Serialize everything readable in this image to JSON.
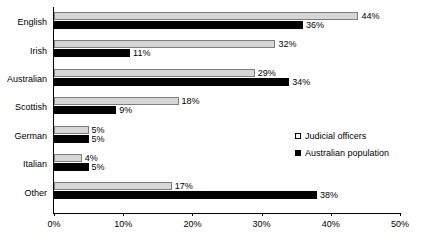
{
  "chart_data": {
    "type": "bar",
    "orientation": "horizontal",
    "title": "",
    "xlabel": "",
    "ylabel": "",
    "xlim": [
      0,
      50
    ],
    "grid": false,
    "legend_position": "middle-right",
    "categories": [
      "English",
      "Irish",
      "Australian",
      "Scottish",
      "German",
      "Italian",
      "Other"
    ],
    "x_tick_labels": [
      "0%",
      "10%",
      "20%",
      "30%",
      "40%",
      "50%"
    ],
    "x_ticks": [
      0,
      10,
      20,
      30,
      40,
      50
    ],
    "series": [
      {
        "name": "Judicial officers",
        "color": "#d6d6d6",
        "values": [
          44,
          32,
          29,
          18,
          5,
          4,
          17
        ],
        "labels": [
          "44%",
          "32%",
          "29%",
          "18%",
          "5%",
          "4%",
          "17%"
        ]
      },
      {
        "name": "Australian population",
        "color": "#000000",
        "values": [
          36,
          11,
          34,
          9,
          5,
          5,
          38
        ],
        "labels": [
          "36%",
          "11%",
          "34%",
          "9%",
          "5%",
          "5%",
          "38%"
        ]
      }
    ]
  },
  "legend": {
    "items": [
      {
        "label": "Judicial officers",
        "swatch": "legend-swatch-judicial-officers"
      },
      {
        "label": "Australian population",
        "swatch": "legend-swatch-australian-population"
      }
    ]
  },
  "colors": {
    "judicial_officers": "#d6d6d6",
    "australian_population": "#000000",
    "axis": "#000000",
    "background": "#ffffff"
  }
}
